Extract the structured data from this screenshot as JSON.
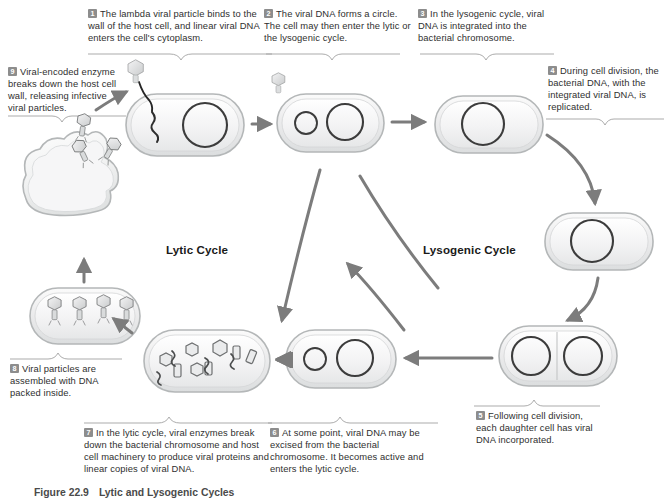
{
  "figure": {
    "caption_number": "Figure 22.9",
    "caption_title": "Lytic and Lysogenic Cycles"
  },
  "cycle_labels": {
    "lytic": "Lytic Cycle",
    "lysogenic": "Lysogenic Cycle"
  },
  "steps": [
    {
      "number": "1",
      "text": "The lambda viral particle binds to the wall of the host cell, and linear viral DNA enters the cell's cytoplasm."
    },
    {
      "number": "2",
      "text": "The viral DNA forms a circle. The cell may then enter the lytic or the lysogenic cycle."
    },
    {
      "number": "3",
      "text": "In the lysogenic cycle, viral DNA is integrated into the bacterial chromosome."
    },
    {
      "number": "4",
      "text": "During cell division, the bacterial DNA, with the integrated viral DNA, is replicated."
    },
    {
      "number": "5",
      "text": "Following cell division, each daughter cell has viral DNA incorporated."
    },
    {
      "number": "6",
      "text": "At some point, viral DNA may be excised from the bacterial chromosome. It becomes active and enters the lytic cycle."
    },
    {
      "number": "7",
      "text": "In the lytic cycle, viral enzymes break down the bacterial chromosome and host cell machinery to produce viral proteins and linear copies of viral DNA."
    },
    {
      "number": "8",
      "text": "Viral particles are assembled with DNA packed inside."
    },
    {
      "number": "9",
      "text": "Viral-encoded enzyme breaks down the host cell wall, releasing infective viral particles."
    }
  ],
  "colors": {
    "cell_fill": "#eceded",
    "cell_stroke": "#b9bcbd",
    "dna_stroke": "#3a3a3a",
    "arrow": "#7c7c7c",
    "number_badge": "#8d8d8d",
    "text": "#2f2f2f",
    "bracket": "#9a9a9a"
  }
}
